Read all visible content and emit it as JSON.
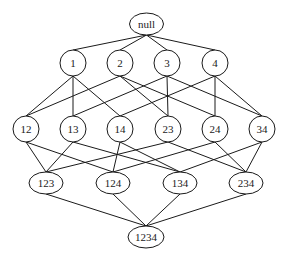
{
  "diagram": {
    "type": "lattice",
    "nodes": [
      {
        "id": "null",
        "label": "null",
        "x": 146.5,
        "y": 24,
        "rx": 17,
        "ry": 11
      },
      {
        "id": "1",
        "label": "1",
        "x": 73,
        "y": 63,
        "rx": 13,
        "ry": 13
      },
      {
        "id": "2",
        "label": "2",
        "x": 120,
        "y": 63,
        "rx": 13,
        "ry": 13
      },
      {
        "id": "3",
        "label": "3",
        "x": 167,
        "y": 63,
        "rx": 13,
        "ry": 13
      },
      {
        "id": "4",
        "label": "4",
        "x": 215,
        "y": 63,
        "rx": 13,
        "ry": 13
      },
      {
        "id": "12",
        "label": "12",
        "x": 26,
        "y": 129,
        "rx": 13,
        "ry": 13
      },
      {
        "id": "13",
        "label": "13",
        "x": 73,
        "y": 129,
        "rx": 13,
        "ry": 13
      },
      {
        "id": "14",
        "label": "14",
        "x": 120,
        "y": 129,
        "rx": 13,
        "ry": 13
      },
      {
        "id": "23",
        "label": "23",
        "x": 168,
        "y": 129,
        "rx": 13,
        "ry": 13
      },
      {
        "id": "24",
        "label": "24",
        "x": 215,
        "y": 129,
        "rx": 13,
        "ry": 13
      },
      {
        "id": "34",
        "label": "34",
        "x": 262,
        "y": 129,
        "rx": 13,
        "ry": 13
      },
      {
        "id": "123",
        "label": "123",
        "x": 46,
        "y": 183,
        "rx": 17,
        "ry": 11
      },
      {
        "id": "124",
        "label": "124",
        "x": 113,
        "y": 183,
        "rx": 17,
        "ry": 11
      },
      {
        "id": "134",
        "label": "134",
        "x": 180,
        "y": 183,
        "rx": 17,
        "ry": 11
      },
      {
        "id": "234",
        "label": "234",
        "x": 246,
        "y": 183,
        "rx": 17,
        "ry": 11
      },
      {
        "id": "1234",
        "label": "1234",
        "x": 146,
        "y": 237,
        "rx": 18,
        "ry": 11
      }
    ],
    "edges": [
      [
        "null",
        "1"
      ],
      [
        "null",
        "2"
      ],
      [
        "null",
        "3"
      ],
      [
        "null",
        "4"
      ],
      [
        "1",
        "12"
      ],
      [
        "1",
        "13"
      ],
      [
        "1",
        "14"
      ],
      [
        "2",
        "12"
      ],
      [
        "2",
        "23"
      ],
      [
        "2",
        "24"
      ],
      [
        "3",
        "13"
      ],
      [
        "3",
        "23"
      ],
      [
        "3",
        "34"
      ],
      [
        "4",
        "14"
      ],
      [
        "4",
        "24"
      ],
      [
        "4",
        "34"
      ],
      [
        "12",
        "123"
      ],
      [
        "12",
        "124"
      ],
      [
        "13",
        "123"
      ],
      [
        "13",
        "134"
      ],
      [
        "14",
        "124"
      ],
      [
        "14",
        "134"
      ],
      [
        "23",
        "123"
      ],
      [
        "23",
        "234"
      ],
      [
        "24",
        "124"
      ],
      [
        "24",
        "234"
      ],
      [
        "34",
        "134"
      ],
      [
        "34",
        "234"
      ],
      [
        "123",
        "1234"
      ],
      [
        "124",
        "1234"
      ],
      [
        "134",
        "1234"
      ],
      [
        "234",
        "1234"
      ]
    ]
  }
}
